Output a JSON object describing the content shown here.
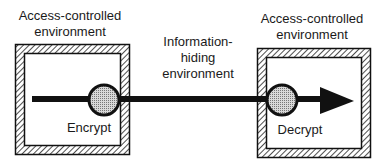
{
  "diagram": {
    "left_environment": {
      "label_line1": "Access-controlled",
      "label_line2": "environment",
      "process_label": "Encrypt"
    },
    "middle_environment": {
      "label_line1": "Information-",
      "label_line2": "hiding",
      "label_line3": "environment"
    },
    "right_environment": {
      "label_line1": "Access-controlled",
      "label_line2": "environment",
      "process_label": "Decrypt"
    },
    "colors": {
      "stroke": "#111111",
      "node_fill": "#bdbdbd",
      "background": "#ffffff"
    }
  }
}
